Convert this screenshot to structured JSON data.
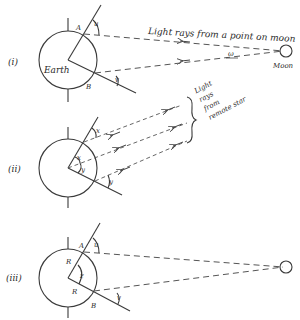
{
  "diagram": {
    "panels": [
      {
        "id": "i",
        "label": "(i)",
        "earth_label": "Earth",
        "point_a": "A",
        "point_b": "B",
        "angle_u": "u",
        "angle_v": "v",
        "angle_w": "ω",
        "rays_caption": "Light rays from a point on moon",
        "target_label": "Moon"
      },
      {
        "id": "ii",
        "label": "(ii)",
        "angle_x_outer": "x",
        "angle_x_inner": "x",
        "angle_y_inner": "y",
        "angle_y_outer": "y",
        "rays_caption_lines": [
          "Light",
          "rays",
          "from",
          "remote star"
        ]
      },
      {
        "id": "iii",
        "label": "(iii)",
        "point_a": "A",
        "point_b": "B",
        "radius_a": "R",
        "radius_b": "R",
        "angle_z": "z",
        "angle_u": "u",
        "angle_v": "v"
      }
    ],
    "colors": {
      "line": "#3a3a3a",
      "dash": "#555555",
      "background": "#ffffff"
    }
  }
}
